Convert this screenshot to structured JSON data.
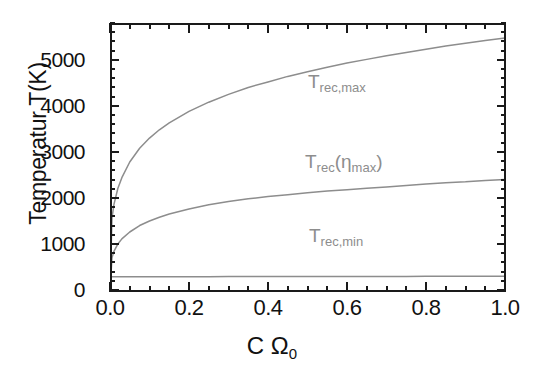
{
  "chart_data": {
    "type": "line",
    "title": "",
    "xlabel": "C Ω₀",
    "ylabel": "Temperatur T(K)",
    "xlim": [
      0.0,
      1.0
    ],
    "ylim": [
      0,
      5800
    ],
    "grid": false,
    "legend_position": "inline-annotations",
    "x_ticks": [
      "0.0",
      "0.2",
      "0.4",
      "0.6",
      "0.8",
      "1.0"
    ],
    "x_tick_values": [
      0.0,
      0.2,
      0.4,
      0.6,
      0.8,
      1.0
    ],
    "y_ticks": [
      "0",
      "1000",
      "2000",
      "3000",
      "4000",
      "5000"
    ],
    "y_tick_values": [
      0,
      1000,
      2000,
      3000,
      4000,
      5000
    ],
    "x": [
      0.0,
      0.005,
      0.01,
      0.02,
      0.03,
      0.05,
      0.075,
      0.1,
      0.125,
      0.15,
      0.2,
      0.25,
      0.3,
      0.35,
      0.4,
      0.45,
      0.5,
      0.55,
      0.6,
      0.65,
      0.7,
      0.75,
      0.8,
      0.85,
      0.9,
      0.95,
      1.0
    ],
    "series": [
      {
        "name": "T_rec,max",
        "label": "T",
        "label_sub": "rec,max",
        "color": "#8d8d8d",
        "values": [
          0,
          1560,
          1860,
          2210,
          2440,
          2780,
          3080,
          3300,
          3480,
          3630,
          3880,
          4080,
          4250,
          4400,
          4520,
          4640,
          4740,
          4840,
          4930,
          5010,
          5090,
          5160,
          5230,
          5300,
          5360,
          5420,
          5475
        ]
      },
      {
        "name": "T_rec(eta_max)",
        "label": "T",
        "label_sub": "rec",
        "label_paren": "(η",
        "label_paren_sub": "max",
        "label_close": ")",
        "color": "#8d8d8d",
        "values": [
          0,
          700,
          840,
          1000,
          1110,
          1260,
          1400,
          1500,
          1580,
          1650,
          1760,
          1850,
          1920,
          1980,
          2030,
          2070,
          2110,
          2150,
          2180,
          2210,
          2240,
          2270,
          2300,
          2330,
          2350,
          2380,
          2400
        ]
      },
      {
        "name": "T_rec,min",
        "label": "T",
        "label_sub": "rec,min",
        "color": "#8d8d8d",
        "values": [
          288,
          288,
          288,
          288,
          288,
          288,
          288,
          289,
          289,
          289,
          290,
          290,
          291,
          291,
          292,
          292,
          293,
          293,
          294,
          294,
          295,
          295,
          296,
          296,
          297,
          297,
          298
        ]
      }
    ]
  },
  "axis": {
    "y_title": "Temperatur T(K)",
    "x_title_main": "C Ω",
    "x_title_sub": "0"
  },
  "annotations": {
    "max": {
      "base": "T",
      "sub": "rec,max"
    },
    "eta": {
      "base": "T",
      "sub": "rec",
      "open": "(η",
      "sub2": "max",
      "close": ")"
    },
    "min": {
      "base": "T",
      "sub": "rec,min"
    }
  },
  "colors": {
    "curve": "#8d8d8d",
    "axis": "#1a1a1a",
    "text": "#111111",
    "background": "#ffffff"
  }
}
